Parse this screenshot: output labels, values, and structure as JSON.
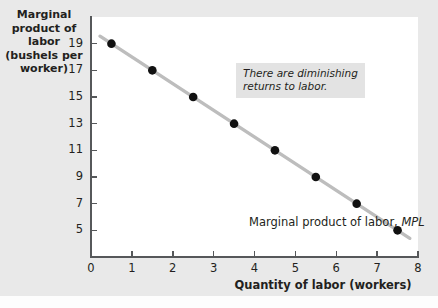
{
  "chart_data": {
    "type": "line",
    "title": "",
    "xlabel": "Quantity of labor (workers)",
    "ylabel": "Marginal product of labor (bushels per worker)",
    "ylabel_lines": [
      "Marginal",
      "product of labor",
      "(bushels per",
      "worker)"
    ],
    "x": [
      0.5,
      1.5,
      2.5,
      3.5,
      4.5,
      5.5,
      6.5,
      7.5
    ],
    "values": [
      19,
      17,
      15,
      13,
      11,
      9,
      7,
      5
    ],
    "series": [
      {
        "name": "Marginal product of labor, MPL",
        "x": [
          0.5,
          1.5,
          2.5,
          3.5,
          4.5,
          5.5,
          6.5,
          7.5
        ],
        "values": [
          19,
          17,
          15,
          13,
          11,
          9,
          7,
          5
        ]
      }
    ],
    "xlim": [
      0,
      8
    ],
    "ylim": [
      3,
      21
    ],
    "xticks": [
      0,
      1,
      2,
      3,
      4,
      5,
      6,
      7,
      8
    ],
    "xtick_labels": [
      "0",
      "1",
      "2",
      "3",
      "4",
      "5",
      "6",
      "7",
      "8"
    ],
    "yticks": [
      19,
      17,
      15,
      13,
      11,
      9,
      7,
      5
    ],
    "ytick_labels": [
      "19",
      "17",
      "15",
      "13",
      "11",
      "9",
      "7",
      "5"
    ],
    "grid": false,
    "legend_position": "none",
    "marker": "filled-circle",
    "marker_color": "#111111",
    "line_color": "#bdbdbd",
    "annotations": [
      {
        "name": "diminishing-returns-note",
        "text": "There are diminishing\nreturns to labor.",
        "style": "italic",
        "background": "#e3e3e3"
      },
      {
        "name": "series-curve-label",
        "text_prefix": "Marginal product of labor, ",
        "text_emphasis": "MPL",
        "style": "regular-with-italic-emphasis"
      }
    ]
  },
  "colors": {
    "figure_background": "#e9e9e9",
    "plot_background": "#ffffff",
    "axis": "#56585a",
    "text": "#231f20",
    "line": "#bdbdbd",
    "marker": "#111111",
    "annotation_background": "#e3e3e3"
  }
}
